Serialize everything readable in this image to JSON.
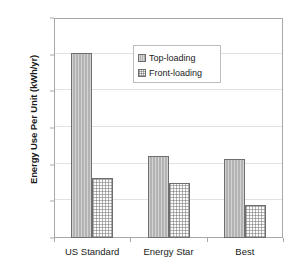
{
  "chart_data": {
    "type": "bar",
    "title": "",
    "xlabel": "",
    "ylabel": "Energy Use Per Unit (kWh/yr)",
    "categories": [
      "US Standard",
      "Energy Star",
      "Best"
    ],
    "series": [
      {
        "name": "Top-loading",
        "values": [
          1010,
          445,
          430
        ]
      },
      {
        "name": "Front-loading",
        "values": [
          325,
          300,
          180
        ]
      }
    ],
    "ylim": [
      0,
      1200
    ],
    "ytick_values": [
      0,
      200,
      400,
      600,
      800,
      1000,
      1200
    ],
    "ytick_labels": [
      "0",
      "200",
      "400",
      "600",
      "800",
      "1000",
      "1200"
    ],
    "grid": true,
    "legend_position": "upper center",
    "colors": {
      "top_loading": "#b3b3b3",
      "front_loading": "#fbfbfb",
      "bar_outline": "#6e6e6e",
      "gridline": "#e2e2e2",
      "axis": "#a8a8a8",
      "text": "#1a1a1a",
      "background": "#ffffff"
    }
  },
  "legend": {
    "items": [
      {
        "label": "Top-loading"
      },
      {
        "label": "Front-loading"
      }
    ]
  }
}
